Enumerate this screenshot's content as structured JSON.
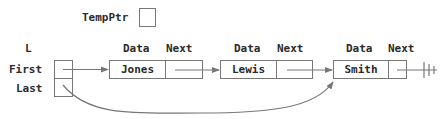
{
  "temp_ptr": {
    "label": "TempPtr"
  },
  "list_header": {
    "label": "L",
    "fields": [
      {
        "label": "First"
      },
      {
        "label": "Last"
      }
    ]
  },
  "node_headers": {
    "data": "Data",
    "next": "Next"
  },
  "nodes": [
    {
      "data": "Jones"
    },
    {
      "data": "Lewis"
    },
    {
      "data": "Smith",
      "next": "null"
    }
  ],
  "colors": {
    "line": "#777777",
    "text": "#2a2a2a"
  }
}
